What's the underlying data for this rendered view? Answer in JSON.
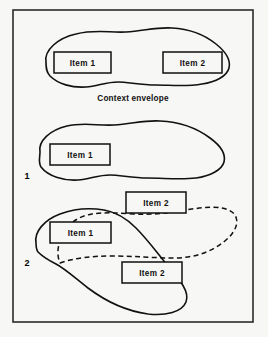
{
  "figure": {
    "background_color": "#f7f7f5",
    "line_color": "#111111",
    "frame": {
      "x": 13,
      "y": 10,
      "width": 240,
      "height": 312
    },
    "caption": "Context envelope",
    "index_labels": [
      {
        "text": "1",
        "x": 27,
        "y": 179
      },
      {
        "text": "2",
        "x": 27,
        "y": 266
      }
    ],
    "groups": [
      {
        "name": "group-top",
        "index": "",
        "envelope_style": "solid",
        "items": [
          {
            "label": "Item 1",
            "x": 54,
            "y": 52,
            "width": 57,
            "height": 21
          },
          {
            "label": "Item 2",
            "x": 163,
            "y": 52,
            "width": 59,
            "height": 21
          }
        ]
      },
      {
        "name": "group-one",
        "index": "1",
        "envelope_style": "solid",
        "items": [
          {
            "label": "Item 1",
            "x": 50,
            "y": 144,
            "width": 60,
            "height": 21
          }
        ]
      },
      {
        "name": "group-two",
        "index": "2",
        "envelope_style": "solid-and-dashed",
        "items": [
          {
            "label": "Item 2",
            "x": 126,
            "y": 192,
            "width": 60,
            "height": 21
          },
          {
            "label": "Item 1",
            "x": 50,
            "y": 222,
            "width": 61,
            "height": 21
          },
          {
            "label": "Item 2",
            "x": 122,
            "y": 262,
            "width": 60,
            "height": 21
          }
        ]
      }
    ]
  }
}
